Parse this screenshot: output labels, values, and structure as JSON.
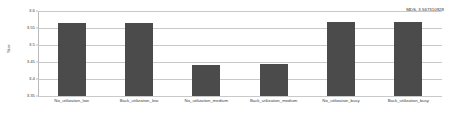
{
  "chart_data": {
    "type": "bar",
    "title": "",
    "subtitle": "",
    "xlabel": "",
    "ylabel": "Size",
    "ylim": [
      3.35,
      3.6
    ],
    "yticks": [
      "3.6",
      "3.55",
      "3.5",
      "3.45",
      "3.4",
      "3.35"
    ],
    "ytick_values": [
      3.6,
      3.55,
      3.5,
      3.45,
      3.4,
      3.35
    ],
    "grid": true,
    "legend": null,
    "legend_position": "none",
    "bar_color": "#4b4b4b",
    "grid_color": "#c9c9c9",
    "axis_color": "#b9b9b9",
    "categories": [
      "No_utilization_low",
      "Back_utilization_low",
      "No_utilization_medium",
      "Back_utilization_medium",
      "No_utilization_busy",
      "Back_utilization_busy"
    ],
    "values": [
      3.565,
      3.565,
      3.44,
      3.443,
      3.567,
      3.567
    ],
    "annotations": [
      {
        "text": "MDS, 3.567310928",
        "position": "top-right"
      }
    ]
  }
}
